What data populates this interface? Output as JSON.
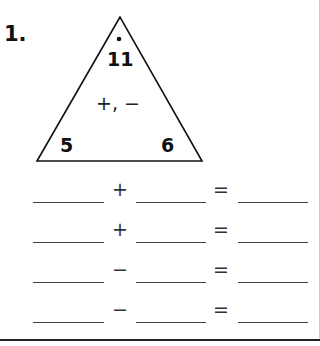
{
  "problem": {
    "number": "1.",
    "triangle": {
      "top": "11",
      "operations": "+, −",
      "left": "5",
      "right": "6"
    },
    "equations": [
      {
        "operator": "+",
        "equals": "="
      },
      {
        "operator": "+",
        "equals": "="
      },
      {
        "operator": "−",
        "equals": "="
      },
      {
        "operator": "−",
        "equals": "="
      }
    ]
  }
}
